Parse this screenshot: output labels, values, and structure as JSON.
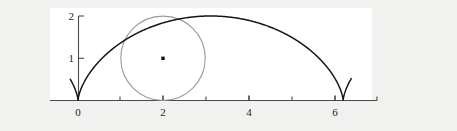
{
  "figure": {
    "background_color": "#f1f1f0",
    "plot_background_color": "#ffffff",
    "title": "",
    "plot_area": {
      "x": 50,
      "y": 8,
      "width": 322,
      "height": 92
    }
  },
  "chart_data": {
    "type": "line",
    "title": "",
    "xlabel": "",
    "ylabel": "",
    "xlim": [
      -0.55,
      7.1
    ],
    "ylim": [
      0,
      2.15
    ],
    "grid": false,
    "legend": null,
    "axes": {
      "x_axis": {
        "position_y": 0,
        "tick_values": [
          0,
          1,
          2,
          3,
          4,
          5,
          6,
          7
        ],
        "labeled_ticks": [
          0,
          2,
          4,
          6
        ],
        "tick_labels": [
          "0",
          "2",
          "4",
          "6"
        ],
        "tick_direction": "out"
      },
      "y_axis": {
        "position_x": 0,
        "tick_values": [
          1,
          2
        ],
        "tick_labels": [
          "1",
          "2"
        ],
        "tick_direction": "out"
      }
    },
    "series": [
      {
        "name": "cycloid",
        "kind": "parametric-curve",
        "color": "#161616",
        "linewidth": 1.5,
        "parametric": {
          "x": "t - sin(t)",
          "y": "1 - cos(t)",
          "t_range": [
            -1.05,
            7.35
          ]
        },
        "features": {
          "cusps_at_x": [
            0,
            6.283
          ],
          "arch_peak": {
            "x": 3.142,
            "y": 2.0
          }
        }
      },
      {
        "name": "osculating-circle",
        "kind": "circle",
        "color": "#9a9a9a",
        "linewidth": 1.1,
        "center": [
          2.0,
          1.0
        ],
        "radius": 1.0,
        "tangent_point": [
          1.0,
          1.3
        ]
      },
      {
        "name": "circle-center-marker",
        "kind": "point",
        "color": "#101010",
        "marker": "square",
        "point": [
          2.0,
          1.0
        ]
      }
    ]
  }
}
